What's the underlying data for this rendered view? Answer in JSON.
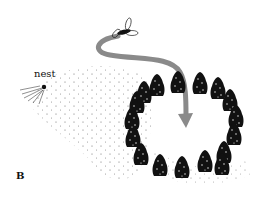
{
  "figure": {
    "panel_label": "B",
    "nest_label": "nest",
    "elements": {
      "insect": {
        "x": 124,
        "y": 32,
        "description": "flying wasp"
      },
      "flight_path": {
        "color": "#8a8a8a",
        "description": "curved arrow from insect into center of tree ring"
      },
      "nest": {
        "x": 44,
        "y": 88,
        "description": "nest entrance with radiating marks"
      },
      "tree_ring": {
        "count": 17,
        "center_x": 186,
        "center_y": 123,
        "tree_color": "#111111"
      },
      "stipple_field": {
        "description": "dotted ground texture between nest and tree ring"
      }
    },
    "colors": {
      "background": "#ffffff",
      "ink": "#111111",
      "arrow": "#8a8a8a"
    }
  }
}
